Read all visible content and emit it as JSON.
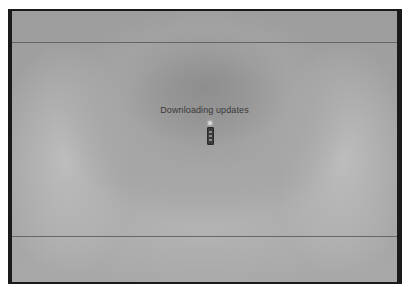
{
  "screen": {
    "status_text": "Downloading updates",
    "indicator_icon": "loading-spinner-icon"
  },
  "colors": {
    "bezel": "#1a1a1a",
    "background": "#a3a3a3",
    "text": "#3a3a3a"
  }
}
